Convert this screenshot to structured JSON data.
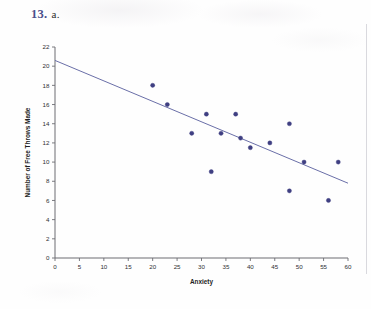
{
  "header": {
    "problem_number": "13.",
    "part_label": "a."
  },
  "chart_data": {
    "type": "scatter",
    "title": "",
    "xlabel": "Anxiety",
    "ylabel": "Number of Free Throws Made",
    "xlim": [
      0,
      60
    ],
    "ylim": [
      0,
      22
    ],
    "xticks": [
      0,
      5,
      10,
      15,
      20,
      25,
      30,
      35,
      40,
      45,
      50,
      55,
      60
    ],
    "yticks": [
      0,
      2,
      4,
      6,
      8,
      10,
      12,
      14,
      16,
      18,
      20,
      22
    ],
    "grid": false,
    "legend": "none",
    "marker_color": "#3f3f82",
    "line_color": "#6a6fa8",
    "points": [
      {
        "x": 20,
        "y": 18
      },
      {
        "x": 23,
        "y": 16
      },
      {
        "x": 28,
        "y": 13
      },
      {
        "x": 31,
        "y": 15
      },
      {
        "x": 32,
        "y": 9
      },
      {
        "x": 34,
        "y": 13
      },
      {
        "x": 37,
        "y": 15
      },
      {
        "x": 38,
        "y": 12.5
      },
      {
        "x": 40,
        "y": 11.5
      },
      {
        "x": 44,
        "y": 12
      },
      {
        "x": 48,
        "y": 14
      },
      {
        "x": 48,
        "y": 7
      },
      {
        "x": 51,
        "y": 10
      },
      {
        "x": 56,
        "y": 6
      },
      {
        "x": 58,
        "y": 10
      }
    ],
    "fit_line": {
      "x_start": 0,
      "y_start": 20.6,
      "x_end": 60,
      "y_end": 7.8
    }
  }
}
